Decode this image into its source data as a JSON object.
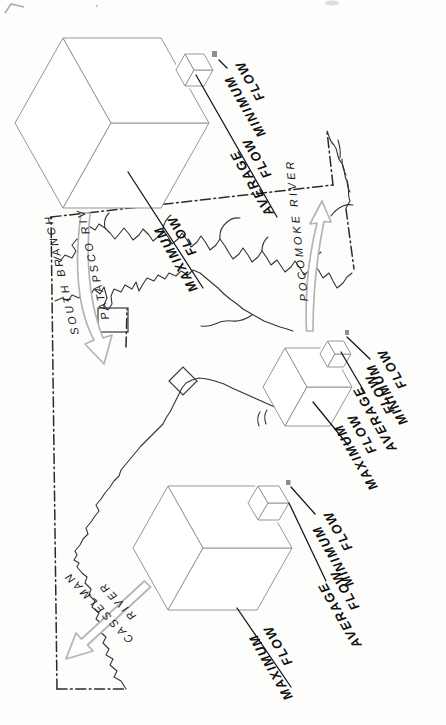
{
  "groups": [
    {
      "id": "south-branch-patapsco",
      "river": {
        "line1": "SOUTH BRANCH",
        "line2": "PATAPSCO RIVER"
      },
      "maximum": {
        "line1": "MAXIMUM",
        "line2": "FLOW"
      },
      "average": {
        "line1": "AVERAGE",
        "line2": "FLOW"
      },
      "minimum": {
        "line1": "MINIMUM",
        "line2": "FLOW"
      }
    },
    {
      "id": "pocomoke",
      "river": {
        "line1": "POCOMOKE RIVER",
        "line2": ""
      },
      "maximum": {
        "line1": "MAXIMUM",
        "line2": "FLOW"
      },
      "average": {
        "line1": "AVERAGE",
        "line2": "FLOW"
      },
      "minimum": {
        "line1": "MINIMUM",
        "line2": "FLOW"
      }
    },
    {
      "id": "casselman",
      "river": {
        "line1": "CASSELMAN",
        "line2": "RIVER"
      },
      "maximum": {
        "line1": "MAXIMUM",
        "line2": "FLOW"
      },
      "average": {
        "line1": "AVERAGE",
        "line2": "FLOW"
      },
      "minimum": {
        "line1": "MINIMUM",
        "line2": "FLOW"
      }
    }
  ],
  "colors": {
    "cube_gray": "#a5a5a5",
    "mini_cube_gray": "#8d8d8d",
    "arrow_outline": "#b4b4b4",
    "label_ink": "#101010",
    "river_ink": "#1a1a1a"
  }
}
